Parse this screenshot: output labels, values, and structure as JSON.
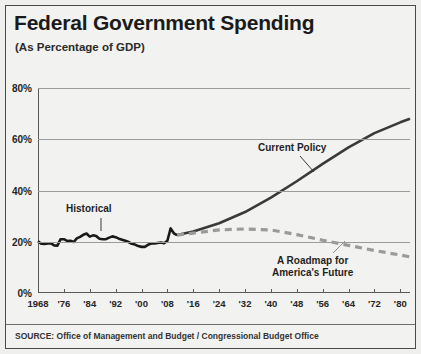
{
  "title": "Federal Government Spending",
  "subtitle": "(As Percentage of GDP)",
  "source": "SOURCE: Office of Management and Budget / Congressional Budget Office",
  "annotations": {
    "historical": "Historical",
    "current_policy": "Current Policy",
    "roadmap_line1": "A Roadmap for",
    "roadmap_line2": "America's Future"
  },
  "colors": {
    "panel_background": "#f2f2f0",
    "frame_border": "#4a4a48",
    "gridline": "#9b9b99",
    "axis": "#59595a",
    "historical_line": "#1a1a1a",
    "current_policy_line": "#3a3a3a",
    "roadmap_line": "#9a9a98",
    "text": "#1a1a1a"
  },
  "chart_data": {
    "type": "line",
    "title": "Federal Government Spending",
    "subtitle": "(As Percentage of GDP)",
    "xlabel": "",
    "ylabel": "",
    "xlim": [
      1968,
      1984
    ],
    "x_display_note": "axis spans 1968 to 1984 in two centuries: 1968-2084",
    "ylim": [
      0,
      80
    ],
    "yticks": [
      0,
      20,
      40,
      60,
      80
    ],
    "ytick_labels": [
      "0%",
      "20%",
      "40%",
      "60%",
      "80%"
    ],
    "xticks": [
      1968,
      1976,
      1984,
      1992,
      2000,
      2008,
      2016,
      2024,
      2032,
      2040,
      2048,
      2056,
      2064,
      2072,
      2080
    ],
    "xtick_labels": [
      "1968",
      "'76",
      "'84",
      "'92",
      "'00",
      "'08",
      "'16",
      "'24",
      "'32",
      "'40",
      "'48",
      "'56",
      "'64",
      "'72",
      "'80"
    ],
    "grid": true,
    "legend": "annotations in plot",
    "series": [
      {
        "name": "Historical",
        "style": "solid",
        "color": "#1a1a1a",
        "points": [
          [
            1968,
            20.2
          ],
          [
            1969,
            19.2
          ],
          [
            1970,
            19.1
          ],
          [
            1971,
            19.3
          ],
          [
            1972,
            19.4
          ],
          [
            1973,
            18.6
          ],
          [
            1974,
            18.5
          ],
          [
            1975,
            21.0
          ],
          [
            1976,
            21.0
          ],
          [
            1977,
            20.3
          ],
          [
            1978,
            20.4
          ],
          [
            1979,
            19.9
          ],
          [
            1980,
            21.3
          ],
          [
            1981,
            21.9
          ],
          [
            1982,
            22.7
          ],
          [
            1983,
            23.2
          ],
          [
            1984,
            22.0
          ],
          [
            1985,
            22.5
          ],
          [
            1986,
            22.2
          ],
          [
            1987,
            21.2
          ],
          [
            1988,
            21.0
          ],
          [
            1989,
            21.0
          ],
          [
            1990,
            21.6
          ],
          [
            1991,
            22.1
          ],
          [
            1992,
            21.8
          ],
          [
            1993,
            21.2
          ],
          [
            1994,
            20.8
          ],
          [
            1995,
            20.4
          ],
          [
            1996,
            19.9
          ],
          [
            1997,
            19.2
          ],
          [
            1998,
            18.9
          ],
          [
            1999,
            18.3
          ],
          [
            2000,
            18.0
          ],
          [
            2001,
            18.0
          ],
          [
            2002,
            18.8
          ],
          [
            2003,
            19.3
          ],
          [
            2004,
            19.3
          ],
          [
            2005,
            19.5
          ],
          [
            2006,
            19.7
          ],
          [
            2007,
            19.4
          ],
          [
            2008,
            20.4
          ],
          [
            2009,
            25.2
          ],
          [
            2010,
            23.3
          ],
          [
            2011,
            22.6
          ]
        ]
      },
      {
        "name": "Current Policy",
        "style": "solid",
        "color": "#3a3a3a",
        "points": [
          [
            2011,
            22.6
          ],
          [
            2016,
            24.0
          ],
          [
            2024,
            27.2
          ],
          [
            2032,
            31.6
          ],
          [
            2040,
            37.2
          ],
          [
            2048,
            43.6
          ],
          [
            2056,
            50.4
          ],
          [
            2064,
            56.8
          ],
          [
            2072,
            62.4
          ],
          [
            2080,
            66.6
          ],
          [
            2083,
            68.0
          ]
        ]
      },
      {
        "name": "A Roadmap for America's Future",
        "style": "dashed",
        "color": "#9a9a98",
        "points": [
          [
            2011,
            22.6
          ],
          [
            2016,
            23.4
          ],
          [
            2024,
            24.6
          ],
          [
            2032,
            25.0
          ],
          [
            2040,
            24.6
          ],
          [
            2048,
            22.8
          ],
          [
            2056,
            20.6
          ],
          [
            2064,
            18.6
          ],
          [
            2072,
            16.6
          ],
          [
            2080,
            14.8
          ],
          [
            2083,
            14.1
          ]
        ]
      }
    ]
  }
}
